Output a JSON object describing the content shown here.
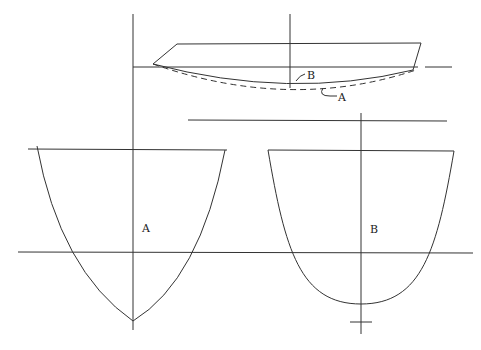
{
  "diagram": {
    "type": "hull-section-comparison",
    "profile": {
      "labels": {
        "curve_b": "B",
        "curve_a": "A"
      },
      "curve_b_style": "solid",
      "curve_a_style": "dashed"
    },
    "sections": [
      {
        "id": "A",
        "label": "A",
        "shape": "V-bottom (pointed keel)"
      },
      {
        "id": "B",
        "label": "B",
        "shape": "round-bottom (U-section)"
      }
    ]
  }
}
